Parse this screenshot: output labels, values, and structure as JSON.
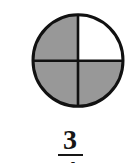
{
  "figure": {
    "shape": "circle",
    "total_parts": 4,
    "shaded_parts": 3,
    "unshaded_parts": 1,
    "shaded_quadrants": [
      "top-left",
      "bottom-left",
      "bottom-right"
    ],
    "unshaded_quadrants": [
      "top-right"
    ]
  },
  "fraction": {
    "numerator": "3",
    "denominator": "4"
  },
  "colors": {
    "shaded_fill": "#989898",
    "unshaded_fill": "#ffffff",
    "outline": "#111111",
    "divider": "#111111",
    "text": "#161616",
    "background": "#ffffff"
  }
}
